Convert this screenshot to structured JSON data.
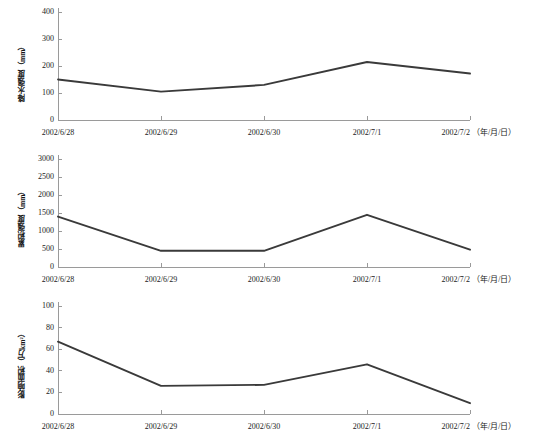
{
  "figure": {
    "background": "#ffffff",
    "line_color": "#3a3a3a",
    "axis_color": "#9a9a9a",
    "x_unit_note": "（年/月/日）"
  },
  "x_categories": [
    "2002/6/28",
    "2002/6/29",
    "2002/6/30",
    "2002/7/1",
    "2002/7/2"
  ],
  "panels": [
    {
      "ylabel": "降水强度（mm）",
      "yticks": [
        "0",
        "100",
        "200",
        "300",
        "400"
      ]
    },
    {
      "ylabel": "累积强度（mm）",
      "yticks": [
        "0",
        "500",
        "1000",
        "1500",
        "2000",
        "2500",
        "3000"
      ]
    },
    {
      "ylabel": "影响面积（万km²）",
      "yticks": [
        "0",
        "20",
        "40",
        "60",
        "80",
        "100"
      ]
    }
  ],
  "chart_data": [
    {
      "type": "line",
      "title": "",
      "xlabel": "（年/月/日）",
      "ylabel": "降水强度（mm）",
      "categories": [
        "2002/6/28",
        "2002/6/29",
        "2002/6/30",
        "2002/7/1",
        "2002/7/2"
      ],
      "values": [
        150,
        105,
        130,
        215,
        172
      ],
      "ylim": [
        0,
        400
      ],
      "yticks": [
        0,
        100,
        200,
        300,
        400
      ],
      "grid": false,
      "legend": false,
      "markers": false
    },
    {
      "type": "line",
      "title": "",
      "xlabel": "（年/月/日）",
      "ylabel": "累积强度（mm）",
      "categories": [
        "2002/6/28",
        "2002/6/29",
        "2002/6/30",
        "2002/7/1",
        "2002/7/2"
      ],
      "values": [
        1400,
        450,
        450,
        1450,
        480
      ],
      "ylim": [
        0,
        3000
      ],
      "yticks": [
        0,
        500,
        1000,
        1500,
        2000,
        2500,
        3000
      ],
      "grid": false,
      "legend": false,
      "markers": false
    },
    {
      "type": "line",
      "title": "",
      "xlabel": "（年/月/日）",
      "ylabel": "影响面积（万km²）",
      "categories": [
        "2002/6/28",
        "2002/6/29",
        "2002/6/30",
        "2002/7/1",
        "2002/7/2"
      ],
      "values": [
        67,
        26,
        27,
        46,
        10
      ],
      "ylim": [
        0,
        100
      ],
      "yticks": [
        0,
        20,
        40,
        60,
        80,
        100
      ],
      "grid": false,
      "legend": false,
      "markers": false
    }
  ]
}
